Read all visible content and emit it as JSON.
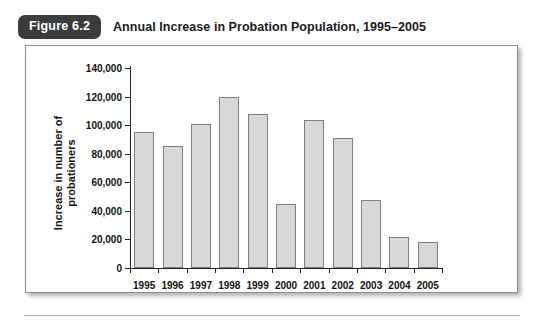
{
  "figure": {
    "badge_label": "Figure 6.2",
    "title": "Annual Increase in Probation Population, 1995–2005"
  },
  "colors": {
    "badge_background": "#3b3b3b",
    "badge_text": "#ffffff",
    "bar_fill": "#d8d8d8",
    "bar_border": "#7d7d7d",
    "axis": "#222222",
    "frame_border": "#8c8c8c"
  },
  "chart_data": {
    "type": "bar",
    "title": "Annual Increase in Probation Population, 1995–2005",
    "xlabel": "",
    "ylabel": "Increase in number of probationers",
    "ylabel_line1": "Increase in number of",
    "ylabel_line2": "probationers",
    "categories": [
      "1995",
      "1996",
      "1997",
      "1998",
      "1999",
      "2000",
      "2001",
      "2002",
      "2003",
      "2004",
      "2005"
    ],
    "values": [
      95000,
      85500,
      100500,
      120000,
      108000,
      44500,
      103500,
      91000,
      47500,
      21500,
      18000
    ],
    "ylim": [
      0,
      140000
    ],
    "ytick_values": [
      0,
      20000,
      40000,
      60000,
      80000,
      100000,
      120000,
      140000
    ],
    "ytick_labels": [
      "0",
      "20,000",
      "40,000",
      "60,000",
      "80,000",
      "100,000",
      "120,000",
      "140,000"
    ],
    "grid": false,
    "legend": false
  }
}
